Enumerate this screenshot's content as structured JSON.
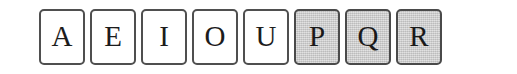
{
  "page": {
    "background_color": "#ffffff"
  },
  "tile_strip": {
    "name": "letter-tiles-row",
    "orientation": "horizontal",
    "tile_count": 8,
    "white_fill_color": "#ffffff",
    "shaded_fill_color": "#c9c9c9",
    "border_color": "#4f4f4f",
    "letter_color": "#1c1c1c",
    "tiles": [
      {
        "letter": "A",
        "shaded": false,
        "state": "unselected"
      },
      {
        "letter": "E",
        "shaded": false,
        "state": "unselected"
      },
      {
        "letter": "I",
        "shaded": false,
        "state": "unselected"
      },
      {
        "letter": "O",
        "shaded": false,
        "state": "unselected"
      },
      {
        "letter": "U",
        "shaded": false,
        "state": "unselected"
      },
      {
        "letter": "P",
        "shaded": true,
        "state": "selected"
      },
      {
        "letter": "Q",
        "shaded": true,
        "state": "selected"
      },
      {
        "letter": "R",
        "shaded": true,
        "state": "selected"
      }
    ]
  }
}
